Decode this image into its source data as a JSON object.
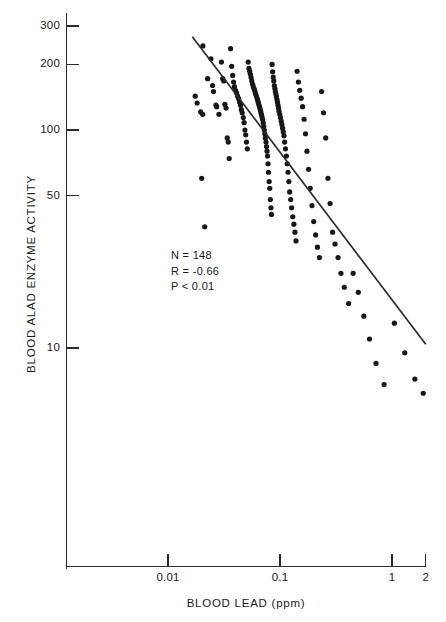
{
  "chart_data": {
    "type": "scatter",
    "title": "",
    "xlabel": "BLOOD LEAD (ppm)",
    "ylabel": "BLOOD ALAD ENZYME ACTIVITY",
    "xscale": "log",
    "yscale": "log",
    "xlim": [
      0.0033,
      2.2
    ],
    "ylim": [
      5.0,
      340
    ],
    "grid": false,
    "legend": null,
    "xticks": [
      {
        "value": 0.01,
        "label": "0.01"
      },
      {
        "value": 0.1,
        "label": "0.1"
      },
      {
        "value": 1,
        "label": "1"
      },
      {
        "value": 2,
        "label": "2"
      }
    ],
    "yticks": [
      {
        "value": 300,
        "label": "300"
      },
      {
        "value": 200,
        "label": "200"
      },
      {
        "value": 100,
        "label": "100"
      },
      {
        "value": 50,
        "label": "50"
      },
      {
        "value": 10,
        "label": "10"
      }
    ],
    "annotations": [
      {
        "name": "sample-size",
        "text": "N = 148"
      },
      {
        "name": "correlation",
        "text": "R = -0.66"
      },
      {
        "name": "p-value",
        "text": "P < 0.01"
      }
    ],
    "marker": {
      "shape": "circle",
      "size_px": 5.2,
      "color": "#171717"
    },
    "fit_line": {
      "name": "regression-line",
      "color": "#2b2b2b",
      "width_px": 1.7,
      "x_start": 0.0165,
      "y_start": 268,
      "x_end": 2.0,
      "y_end": 10.4
    },
    "points": [
      [
        0.0205,
        243
      ],
      [
        0.0175,
        143
      ],
      [
        0.0182,
        133
      ],
      [
        0.0196,
        121
      ],
      [
        0.0204,
        118
      ],
      [
        0.02,
        60
      ],
      [
        0.0213,
        36
      ],
      [
        0.0226,
        172
      ],
      [
        0.0242,
        212
      ],
      [
        0.025,
        160
      ],
      [
        0.0255,
        150
      ],
      [
        0.0268,
        130
      ],
      [
        0.0272,
        128
      ],
      [
        0.0285,
        118
      ],
      [
        0.03,
        205
      ],
      [
        0.0308,
        172
      ],
      [
        0.0315,
        168
      ],
      [
        0.0322,
        131
      ],
      [
        0.033,
        126
      ],
      [
        0.0338,
        92
      ],
      [
        0.0345,
        88
      ],
      [
        0.0352,
        74
      ],
      [
        0.0362,
        236
      ],
      [
        0.037,
        196
      ],
      [
        0.0378,
        178
      ],
      [
        0.0385,
        166
      ],
      [
        0.0392,
        158
      ],
      [
        0.04,
        152
      ],
      [
        0.041,
        148
      ],
      [
        0.0418,
        143
      ],
      [
        0.0428,
        139
      ],
      [
        0.0436,
        134
      ],
      [
        0.0444,
        130
      ],
      [
        0.0452,
        124
      ],
      [
        0.046,
        120
      ],
      [
        0.047,
        114
      ],
      [
        0.0478,
        108
      ],
      [
        0.0486,
        100
      ],
      [
        0.0494,
        95
      ],
      [
        0.0502,
        88
      ],
      [
        0.051,
        82
      ],
      [
        0.052,
        205
      ],
      [
        0.0528,
        192
      ],
      [
        0.0536,
        186
      ],
      [
        0.0544,
        180
      ],
      [
        0.0552,
        174
      ],
      [
        0.056,
        168
      ],
      [
        0.057,
        162
      ],
      [
        0.0578,
        158
      ],
      [
        0.0586,
        155
      ],
      [
        0.0594,
        152
      ],
      [
        0.0602,
        148
      ],
      [
        0.061,
        145
      ],
      [
        0.0618,
        142
      ],
      [
        0.0626,
        139
      ],
      [
        0.0634,
        136
      ],
      [
        0.0642,
        133
      ],
      [
        0.065,
        130
      ],
      [
        0.0658,
        127
      ],
      [
        0.0666,
        124
      ],
      [
        0.0674,
        121
      ],
      [
        0.0682,
        118
      ],
      [
        0.069,
        115
      ],
      [
        0.07,
        112
      ],
      [
        0.0708,
        108
      ],
      [
        0.0716,
        104
      ],
      [
        0.0724,
        100
      ],
      [
        0.0732,
        96
      ],
      [
        0.074,
        92
      ],
      [
        0.075,
        88
      ],
      [
        0.0758,
        84
      ],
      [
        0.0766,
        80
      ],
      [
        0.0774,
        76
      ],
      [
        0.0782,
        70
      ],
      [
        0.079,
        64
      ],
      [
        0.08,
        58
      ],
      [
        0.081,
        54
      ],
      [
        0.082,
        48
      ],
      [
        0.083,
        44
      ],
      [
        0.084,
        41
      ],
      [
        0.085,
        200
      ],
      [
        0.086,
        185
      ],
      [
        0.087,
        175
      ],
      [
        0.088,
        168
      ],
      [
        0.089,
        160
      ],
      [
        0.09,
        155
      ],
      [
        0.091,
        150
      ],
      [
        0.092,
        146
      ],
      [
        0.093,
        142
      ],
      [
        0.094,
        138
      ],
      [
        0.095,
        134
      ],
      [
        0.096,
        130
      ],
      [
        0.097,
        126
      ],
      [
        0.098,
        122
      ],
      [
        0.0995,
        118
      ],
      [
        0.101,
        114
      ],
      [
        0.1025,
        110
      ],
      [
        0.104,
        106
      ],
      [
        0.1055,
        102
      ],
      [
        0.107,
        98
      ],
      [
        0.1085,
        94
      ],
      [
        0.11,
        88
      ],
      [
        0.112,
        82
      ],
      [
        0.114,
        76
      ],
      [
        0.116,
        70
      ],
      [
        0.118,
        64
      ],
      [
        0.12,
        58
      ],
      [
        0.122,
        52
      ],
      [
        0.1245,
        48
      ],
      [
        0.127,
        44
      ],
      [
        0.13,
        40
      ],
      [
        0.133,
        37
      ],
      [
        0.136,
        34
      ],
      [
        0.139,
        31
      ],
      [
        0.142,
        186
      ],
      [
        0.146,
        166
      ],
      [
        0.15,
        152
      ],
      [
        0.1545,
        140
      ],
      [
        0.159,
        128
      ],
      [
        0.164,
        112
      ],
      [
        0.169,
        96
      ],
      [
        0.174,
        80
      ],
      [
        0.18,
        66
      ],
      [
        0.186,
        54
      ],
      [
        0.193,
        45
      ],
      [
        0.2,
        38
      ],
      [
        0.208,
        33
      ],
      [
        0.216,
        29
      ],
      [
        0.225,
        26
      ],
      [
        0.235,
        150
      ],
      [
        0.245,
        120
      ],
      [
        0.256,
        92
      ],
      [
        0.268,
        60
      ],
      [
        0.28,
        46
      ],
      [
        0.295,
        34
      ],
      [
        0.31,
        30
      ],
      [
        0.33,
        26
      ],
      [
        0.35,
        22
      ],
      [
        0.375,
        19
      ],
      [
        0.41,
        16
      ],
      [
        0.45,
        22
      ],
      [
        0.5,
        18
      ],
      [
        0.56,
        14
      ],
      [
        0.63,
        11
      ],
      [
        0.72,
        8.5
      ],
      [
        0.85,
        6.8
      ],
      [
        1.05,
        13
      ],
      [
        1.3,
        9.5
      ],
      [
        1.6,
        7.2
      ],
      [
        1.9,
        6.2
      ]
    ]
  }
}
